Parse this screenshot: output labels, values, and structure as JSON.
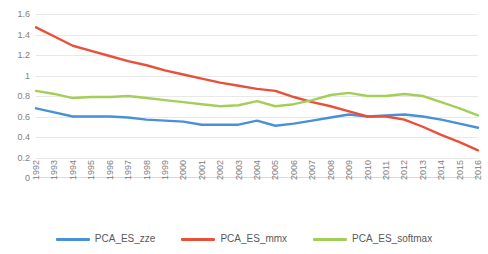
{
  "chart_data": {
    "type": "line",
    "title": "",
    "subtitle": "",
    "xlabel": "",
    "ylabel": "",
    "grid": true,
    "legend_position": "bottom",
    "ylim": [
      0,
      1.6
    ],
    "ytick_labels": [
      "1.6",
      "1.4",
      "1.2",
      "1",
      "0.8",
      "0.6",
      "0.4",
      "0.2",
      "0"
    ],
    "ytick_values": [
      1.6,
      1.4,
      1.2,
      1,
      0.8,
      0.6,
      0.4,
      0.2,
      0
    ],
    "categories": [
      "1992",
      "1993",
      "1994",
      "1995",
      "1996",
      "1997",
      "1998",
      "1999",
      "2000",
      "2001",
      "2002",
      "2003",
      "2004",
      "2005",
      "2006",
      "2007",
      "2008",
      "2009",
      "2010",
      "2011",
      "2012",
      "2013",
      "2014",
      "2015",
      "2016"
    ],
    "series": [
      {
        "name": "PCA_ES_zze",
        "color": "#4A90D9",
        "values": [
          0.68,
          0.64,
          0.6,
          0.6,
          0.6,
          0.59,
          0.57,
          0.56,
          0.55,
          0.52,
          0.52,
          0.52,
          0.56,
          0.51,
          0.53,
          0.56,
          0.59,
          0.62,
          0.6,
          0.61,
          0.62,
          0.6,
          0.57,
          0.53,
          0.49
        ]
      },
      {
        "name": "PCA_ES_mmx",
        "color": "#E8503A",
        "values": [
          1.47,
          1.38,
          1.29,
          1.24,
          1.19,
          1.14,
          1.1,
          1.05,
          1.01,
          0.97,
          0.93,
          0.9,
          0.87,
          0.85,
          0.79,
          0.74,
          0.7,
          0.65,
          0.6,
          0.6,
          0.57,
          0.5,
          0.42,
          0.35,
          0.27
        ]
      },
      {
        "name": "PCA_ES_softmax",
        "color": "#A5CE59",
        "values": [
          0.85,
          0.82,
          0.78,
          0.79,
          0.79,
          0.8,
          0.78,
          0.76,
          0.74,
          0.72,
          0.7,
          0.71,
          0.75,
          0.7,
          0.72,
          0.76,
          0.81,
          0.83,
          0.8,
          0.8,
          0.82,
          0.8,
          0.74,
          0.68,
          0.61
        ]
      }
    ]
  },
  "legend": {
    "items": [
      {
        "label": "PCA_ES_zze"
      },
      {
        "label": "PCA_ES_mmx"
      },
      {
        "label": "PCA_ES_softmax"
      }
    ]
  }
}
